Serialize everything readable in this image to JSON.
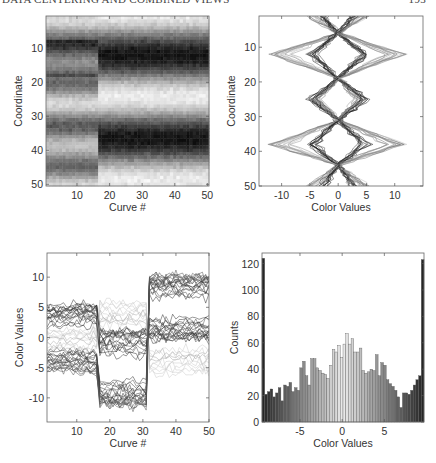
{
  "header": {
    "title": "DATA CENTERING AND COMBINED VIEWS",
    "page": "193"
  },
  "chart_data": [
    {
      "type": "heatmap",
      "title": "",
      "xlabel": "Curve #",
      "ylabel": "Coordinate",
      "xticks": [
        10,
        20,
        30,
        40,
        50
      ],
      "yticks": [
        10,
        20,
        30,
        40,
        50
      ],
      "xlim": [
        1,
        50
      ],
      "ylim": [
        1,
        50
      ],
      "y_reversed": true,
      "colormap": "gray",
      "description": "50x50 grayscale image; curves 1-16 medium gray with light bands at coordinates ~5,20,32,45; curves 17-31 and 32-50 show dark bands at coordinates ~8-18 and ~35-44, light bands at ~1-7, ~20-32, ~45-50",
      "groups": [
        {
          "curves": [
            1,
            16
          ],
          "dark_bands": [
            [
              8,
              18
            ],
            [
              33,
              44
            ]
          ],
          "shade": "medium"
        },
        {
          "curves": [
            17,
            31
          ],
          "dark_bands": [
            [
              8,
              18
            ],
            [
              35,
              44
            ]
          ],
          "shade": "dark"
        },
        {
          "curves": [
            32,
            50
          ],
          "dark_bands": [
            [
              8,
              18
            ],
            [
              35,
              44
            ]
          ],
          "shade": "dark"
        }
      ]
    },
    {
      "type": "line",
      "title": "",
      "xlabel": "Color Values",
      "ylabel": "Coordinate",
      "xticks": [
        -10,
        -5,
        0,
        5,
        10
      ],
      "yticks": [
        10,
        20,
        30,
        40,
        50
      ],
      "xlim": [
        -14,
        15
      ],
      "ylim": [
        1,
        50
      ],
      "y_reversed": true,
      "description": "Each curve plotted vertically: zig-zag diamond shapes crossing near 0 at coordinates ~5, 19, 31, 44; amplitude about +/-5 (dark curves) and +/-10 (light curves)",
      "series": [
        {
          "name": "amplitude 5 (dark)",
          "knots_coord": [
            1,
            6,
            12,
            19,
            25,
            31,
            38,
            44,
            50
          ],
          "values_pos": [
            3,
            0,
            5,
            0,
            5,
            0,
            5,
            0,
            3
          ]
        },
        {
          "name": "amplitude 10 (light)",
          "knots_coord": [
            1,
            6,
            12,
            19,
            25,
            31,
            38,
            44,
            50
          ],
          "values_pos": [
            5,
            0,
            11,
            0,
            4,
            0,
            11,
            0,
            5
          ]
        }
      ]
    },
    {
      "type": "line",
      "title": "",
      "xlabel": "Curve #",
      "ylabel": "Color Values",
      "xticks": [
        10,
        20,
        30,
        40,
        50
      ],
      "yticks": [
        10,
        5,
        0,
        -5,
        -10
      ],
      "xlim": [
        1,
        50
      ],
      "ylim": [
        -14,
        14
      ],
      "description": "50 coordinates plotted as lines across curve number; three segments with jumps at curve ~8.5, ~16.5 and ~31.5",
      "segments": [
        {
          "curves": [
            1,
            8
          ],
          "range": [
            -6,
            6
          ]
        },
        {
          "curves": [
            9,
            16
          ],
          "range": [
            -8,
            6
          ]
        },
        {
          "curves": [
            17,
            31
          ],
          "range_dark": [
            -12,
            1
          ],
          "range_light": [
            0,
            11
          ]
        },
        {
          "curves": [
            32,
            50
          ],
          "range_dark": [
            0,
            10
          ],
          "range_light": [
            -10,
            0
          ]
        }
      ]
    },
    {
      "type": "bar",
      "title": "",
      "xlabel": "Color Values",
      "ylabel": "Counts",
      "xticks": [
        -5,
        0,
        5
      ],
      "yticks": [
        0,
        20,
        40,
        60,
        80,
        100,
        120
      ],
      "xlim": [
        -9.5,
        9.7
      ],
      "ylim": [
        0,
        128
      ],
      "bin_count": 60,
      "values": [
        124,
        21,
        23,
        25,
        19,
        22,
        26,
        16,
        28,
        27,
        30,
        23,
        26,
        24,
        41,
        46,
        35,
        28,
        48,
        48,
        41,
        39,
        37,
        36,
        33,
        43,
        55,
        53,
        58,
        49,
        59,
        67,
        59,
        63,
        53,
        53,
        56,
        39,
        37,
        38,
        40,
        39,
        51,
        35,
        45,
        43,
        32,
        29,
        27,
        24,
        19,
        11,
        22,
        22,
        21,
        24,
        28,
        32,
        35,
        123
      ],
      "colors": "gray gradient: dark at extremes, light near 0"
    }
  ]
}
